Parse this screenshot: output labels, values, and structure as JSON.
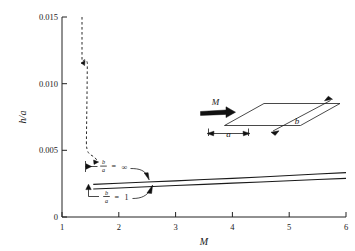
{
  "figure": {
    "name": "h-over-a-versus-mach-number-chart",
    "background_color": "#ffffff",
    "ink_color": "#1a1a1a"
  },
  "chart_data": {
    "type": "line",
    "title": "",
    "subtitle": "",
    "xlabel": "M",
    "ylabel": "h/a",
    "xlim": [
      1,
      6
    ],
    "ylim": [
      0,
      0.015
    ],
    "grid": false,
    "legend_position": "inline-annotations",
    "x_ticks": [
      1,
      2,
      3,
      4,
      5,
      6
    ],
    "x_tick_labels": [
      "1",
      "2",
      "3",
      "4",
      "5",
      "6"
    ],
    "y_ticks": [
      0,
      0.005,
      0.01,
      0.015
    ],
    "y_tick_labels": [
      "0",
      "0.005",
      "0.010",
      "0.015"
    ],
    "series": [
      {
        "name": "b/a = ∞",
        "style": "solid",
        "label": "b/a = ∞",
        "label_numerator": "b",
        "label_denominator": "a",
        "label_value": "∞",
        "x": [
          1.55,
          2.0,
          2.5,
          3.0,
          3.5,
          4.0,
          4.5,
          5.0,
          5.5,
          6.0
        ],
        "values": [
          0.00245,
          0.00253,
          0.00262,
          0.00271,
          0.00281,
          0.0029,
          0.003,
          0.00311,
          0.00322,
          0.00333
        ]
      },
      {
        "name": "b/a = 1",
        "style": "solid",
        "label": "b/a = 1",
        "label_numerator": "b",
        "label_denominator": "a",
        "label_value": "1",
        "x": [
          1.55,
          2.0,
          2.5,
          3.0,
          3.5,
          4.0,
          4.5,
          5.0,
          5.5,
          6.0
        ],
        "values": [
          0.0021,
          0.00218,
          0.00227,
          0.00236,
          0.00245,
          0.00254,
          0.00263,
          0.00272,
          0.00281,
          0.0029
        ]
      },
      {
        "name": "low-Mach asymptote",
        "style": "dashed",
        "label": "",
        "x": [
          1.37,
          1.37,
          1.4,
          1.44,
          1.47,
          1.47,
          1.47,
          1.5,
          1.53,
          1.55
        ],
        "values": [
          0.015,
          0.0108,
          0.0104,
          0.0107,
          0.0101,
          0.007,
          0.0042,
          0.0034,
          0.0026,
          0.0022
        ]
      }
    ],
    "annotations": [
      {
        "name": "b-over-a-infinity-label",
        "text": "b/a = ∞",
        "numerator": "b",
        "denominator": "a",
        "equals": "=",
        "value": "∞",
        "points_to_series": "b/a = ∞"
      },
      {
        "name": "b-over-a-one-label",
        "text": "b/a = 1",
        "numerator": "b",
        "denominator": "a",
        "equals": "=",
        "value": "1",
        "points_to_series": "b/a = 1"
      }
    ]
  },
  "inset": {
    "name": "flat-plate-schematic",
    "mach_label": "M",
    "width_label": "a",
    "length_label": "b"
  }
}
